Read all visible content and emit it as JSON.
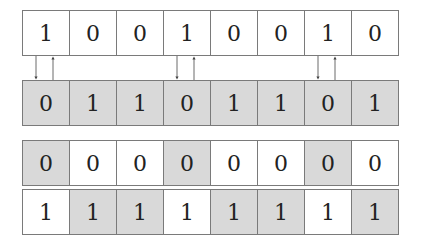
{
  "rows": [
    {
      "name": "input-bits",
      "top": 10,
      "bits": [
        "1",
        "0",
        "0",
        "1",
        "0",
        "0",
        "1",
        "0"
      ],
      "shaded": [
        false,
        false,
        false,
        false,
        false,
        false,
        false,
        false
      ]
    },
    {
      "name": "complement-bits",
      "top": 80,
      "bits": [
        "0",
        "1",
        "1",
        "0",
        "1",
        "1",
        "0",
        "1"
      ],
      "shaded": [
        true,
        true,
        true,
        true,
        true,
        true,
        true,
        true
      ]
    },
    {
      "name": "zero-row",
      "top": 140,
      "bits": [
        "0",
        "0",
        "0",
        "0",
        "0",
        "0",
        "0",
        "0"
      ],
      "shaded": [
        true,
        false,
        false,
        true,
        false,
        false,
        true,
        false
      ]
    },
    {
      "name": "one-row",
      "top": 188,
      "bits": [
        "1",
        "1",
        "1",
        "1",
        "1",
        "1",
        "1",
        "1"
      ],
      "shaded": [
        false,
        true,
        true,
        false,
        true,
        true,
        false,
        true
      ]
    }
  ],
  "arrow_columns": [
    0,
    3,
    6
  ],
  "colors": {
    "shade": "#d9d9d9",
    "border": "#7a7a7a",
    "arrow": "#444444"
  }
}
